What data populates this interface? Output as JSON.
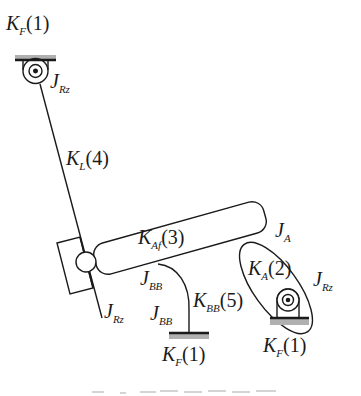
{
  "figure": {
    "labels": {
      "top_ground": {
        "main": "K",
        "sub": "F",
        "tail": "(1)"
      },
      "top_joint": {
        "main": "J",
        "sub": "Rz"
      },
      "link": {
        "main": "K",
        "sub": "L",
        "tail": "(4)"
      },
      "bar": {
        "main": "K",
        "sub": "Af",
        "tail": "(3)"
      },
      "bar_joint": {
        "main": "J",
        "sub": "A"
      },
      "ellipse_spring": {
        "main": "K",
        "sub": "A",
        "tail": "(2)"
      },
      "right_joint": {
        "main": "J",
        "sub": "Rz"
      },
      "bb_joint_upper": {
        "main": "J",
        "sub": "BB"
      },
      "bb_joint_lower": {
        "main": "J",
        "sub": "BB"
      },
      "bb_spring": {
        "main": "K",
        "sub": "BB",
        "tail": "(5)"
      },
      "lower_left_joint": {
        "main": "J",
        "sub": "Rz"
      },
      "bottom_ground_mid": {
        "main": "K",
        "sub": "F",
        "tail": "(1)"
      },
      "bottom_ground_right": {
        "main": "K",
        "sub": "F",
        "tail": "(1)"
      }
    },
    "colors": {
      "stroke": "#1a1a1a",
      "ground_hatch": "#b0b0b0"
    }
  },
  "caption": {
    "text": ""
  }
}
